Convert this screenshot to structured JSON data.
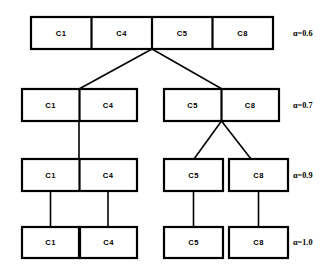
{
  "diagram": {
    "type": "hierarchical-clustering-dendrogram",
    "levels": [
      {
        "id": "level-1",
        "alpha_label": "α=0.6",
        "alpha_symbol": "α",
        "alpha_value": "0.6",
        "groups": [
          {
            "cells": [
              "C1",
              "C4",
              "C5",
              "C8"
            ]
          }
        ]
      },
      {
        "id": "level-2",
        "alpha_label": "α=0.7",
        "alpha_symbol": "α",
        "alpha_value": "0.7",
        "groups": [
          {
            "cells": [
              "C1",
              "C4"
            ]
          },
          {
            "cells": [
              "C5",
              "C8"
            ]
          }
        ]
      },
      {
        "id": "level-3",
        "alpha_label": "α=0.9",
        "alpha_symbol": "α",
        "alpha_value": "0.9",
        "groups": [
          {
            "cells": [
              "C1",
              "C4"
            ]
          },
          {
            "cells": [
              "C5"
            ]
          },
          {
            "cells": [
              "C8"
            ]
          }
        ]
      },
      {
        "id": "level-4",
        "alpha_label": "α=1.0",
        "alpha_symbol": "α",
        "alpha_value": "1.0",
        "groups": [
          {
            "cells": [
              "C1"
            ]
          },
          {
            "cells": [
              "C4"
            ]
          },
          {
            "cells": [
              "C5"
            ]
          },
          {
            "cells": [
              "C8"
            ]
          }
        ]
      }
    ],
    "labels": {
      "l1c1": "C1",
      "l1c2": "C4",
      "l1c3": "C5",
      "l1c4": "C8",
      "l2c1": "C1",
      "l2c2": "C4",
      "l2c3": "C5",
      "l2c4": "C8",
      "l3c1": "C1",
      "l3c2": "C4",
      "l3c3": "C5",
      "l3c4": "C8",
      "l4c1": "C1",
      "l4c2": "C4",
      "l4c3": "C5",
      "l4c4": "C8",
      "a1": "α=0.6",
      "a2": "α=0.7",
      "a3": "α=0.9",
      "a4": "α=1.0"
    },
    "colors": {
      "stroke": "#000000",
      "fill": "#ffffff",
      "background": "#ffffff"
    }
  }
}
